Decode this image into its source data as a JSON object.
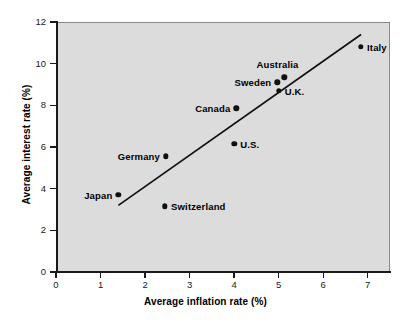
{
  "chart_data": {
    "type": "scatter",
    "title": "",
    "xlabel": "Average inflation rate (%)",
    "ylabel": "Average interest rate (%)",
    "xlim": [
      0,
      7.5
    ],
    "ylim": [
      0,
      12
    ],
    "xticks": [
      0,
      1,
      2,
      3,
      4,
      5,
      6,
      7
    ],
    "yticks": [
      0,
      2,
      4,
      6,
      8,
      10,
      12
    ],
    "xtick_labels": [
      "0",
      "1",
      "2",
      "3",
      "4",
      "5",
      "6",
      "7"
    ],
    "ytick_labels": [
      "0",
      "2",
      "4",
      "6",
      "8",
      "10",
      "12"
    ],
    "grid": false,
    "legend": false,
    "points": [
      {
        "label": "Japan",
        "x": 1.4,
        "y": 3.7,
        "label_pos": "left"
      },
      {
        "label": "Switzerland",
        "x": 2.45,
        "y": 3.15,
        "label_pos": "right"
      },
      {
        "label": "Germany",
        "x": 2.47,
        "y": 5.55,
        "label_pos": "left"
      },
      {
        "label": "U.S.",
        "x": 4.0,
        "y": 6.15,
        "label_pos": "right"
      },
      {
        "label": "Canada",
        "x": 4.05,
        "y": 7.85,
        "label_pos": "left"
      },
      {
        "label": "Sweden",
        "x": 4.97,
        "y": 9.1,
        "label_pos": "left"
      },
      {
        "label": "Australia",
        "x": 5.13,
        "y": 9.35,
        "label_pos": "above"
      },
      {
        "label": "U.K.",
        "x": 5.0,
        "y": 8.7,
        "label_pos": "right"
      },
      {
        "label": "Italy",
        "x": 6.85,
        "y": 10.8,
        "label_pos": "right"
      }
    ],
    "trendline": {
      "x0": 1.4,
      "y0": 3.2,
      "x1": 6.85,
      "y1": 11.4
    },
    "colors": {
      "plot_background": "#dcdcdc",
      "page_background": "#ffffff",
      "marker": "#101010",
      "axis": "#1a1a1a",
      "trendline": "#101010"
    }
  }
}
